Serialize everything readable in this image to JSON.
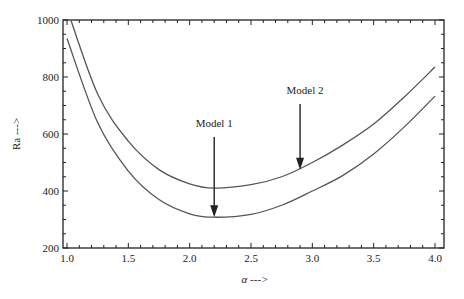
{
  "chart_data": {
    "type": "line",
    "title": "",
    "xlabel": "α --->",
    "ylabel": "Ra --->",
    "xlim": [
      1.0,
      4.0
    ],
    "ylim": [
      200,
      1000
    ],
    "grid": false,
    "legend": null,
    "x_ticks": [
      "1.0",
      "1.5",
      "2.0",
      "2.5",
      "3.0",
      "3.5",
      "4.0"
    ],
    "y_ticks": [
      "200",
      "400",
      "600",
      "800",
      "1000"
    ],
    "x": [
      1.0,
      1.25,
      1.5,
      1.75,
      2.0,
      2.2,
      2.5,
      2.75,
      3.0,
      3.25,
      3.5,
      3.75,
      4.0
    ],
    "series": [
      {
        "name": "Model 1",
        "values": [
          935,
          640,
          470,
          370,
          320,
          308,
          318,
          350,
          400,
          455,
          530,
          625,
          733
        ]
      },
      {
        "name": "Model 2",
        "values": [
          1040,
          740,
          575,
          475,
          425,
          410,
          422,
          450,
          500,
          562,
          635,
          730,
          835
        ]
      }
    ],
    "annotations": [
      {
        "text": "Model 1",
        "arrow_to": {
          "x": 2.2,
          "y": 308
        }
      },
      {
        "text": "Model 2",
        "arrow_to": {
          "x": 2.9,
          "y": 475
        }
      }
    ]
  }
}
